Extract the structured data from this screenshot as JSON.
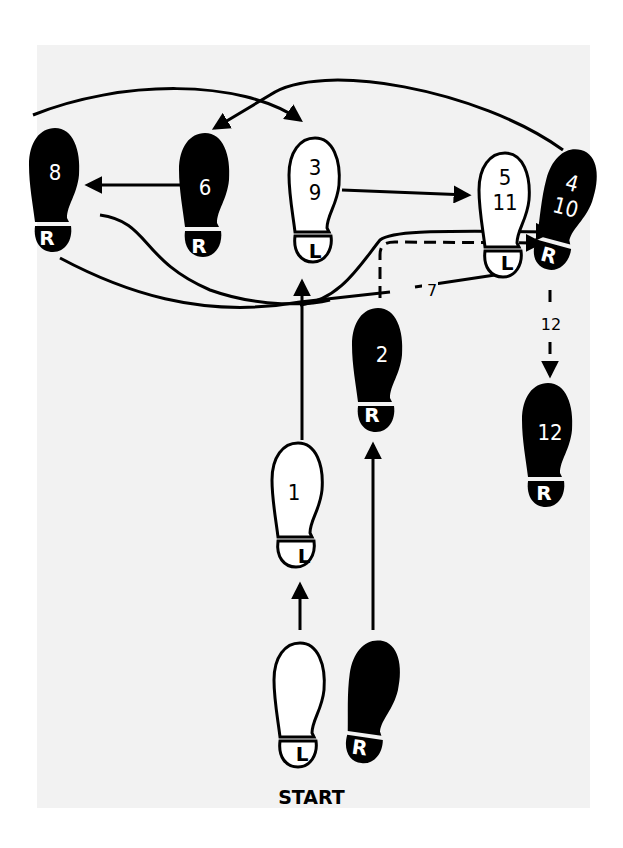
{
  "start_label": "START",
  "colors": {
    "ink": "#000000",
    "paper": "#f2f2f2",
    "background": "#ffffff"
  },
  "footprints": [
    {
      "id": "start-left",
      "foot": "L",
      "steps": "",
      "filled": false
    },
    {
      "id": "start-right",
      "foot": "R",
      "steps": "",
      "filled": true
    },
    {
      "id": "step-1",
      "foot": "L",
      "steps": "1",
      "filled": false
    },
    {
      "id": "step-2",
      "foot": "R",
      "steps": "2",
      "filled": true
    },
    {
      "id": "step-3-9",
      "foot": "L",
      "steps": "3\n9",
      "step_a": "3",
      "step_b": "9",
      "filled": false
    },
    {
      "id": "step-4-10",
      "foot": "R",
      "step_a": "4",
      "step_b": "10",
      "filled": true
    },
    {
      "id": "step-5-11",
      "foot": "L",
      "step_a": "5",
      "step_b": "11",
      "filled": false
    },
    {
      "id": "step-6",
      "foot": "R",
      "steps": "6",
      "filled": true
    },
    {
      "id": "step-8",
      "foot": "R",
      "steps": "8",
      "filled": true
    },
    {
      "id": "step-12",
      "foot": "R",
      "steps": "12",
      "filled": true
    }
  ],
  "path_labels": {
    "seven": "7",
    "twelve": "12"
  }
}
